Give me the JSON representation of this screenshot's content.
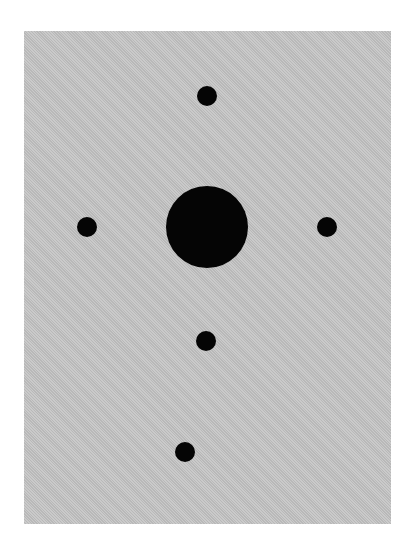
{
  "figure": {
    "panel": {
      "x": 24,
      "y": 31,
      "width": 367,
      "height": 493,
      "color": "#c4c4c4"
    },
    "dot_color": "#050505",
    "dots": [
      {
        "name": "top-small-dot",
        "cx": 207,
        "cy": 96,
        "r": 10
      },
      {
        "name": "center-large-dot",
        "cx": 207,
        "cy": 227,
        "r": 41
      },
      {
        "name": "left-small-dot",
        "cx": 87,
        "cy": 227,
        "r": 10
      },
      {
        "name": "right-small-dot",
        "cx": 327,
        "cy": 227,
        "r": 10
      },
      {
        "name": "lower-middle-small-dot",
        "cx": 206,
        "cy": 341,
        "r": 10
      },
      {
        "name": "bottom-small-dot",
        "cx": 185,
        "cy": 452,
        "r": 10
      }
    ]
  }
}
